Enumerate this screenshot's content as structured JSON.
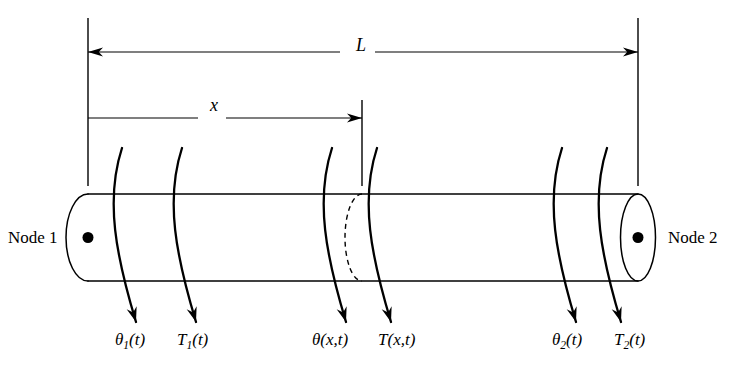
{
  "figure": {
    "stroke_color": "#000000",
    "background_color": "#ffffff",
    "shaft": {
      "left_x": 88,
      "right_x": 638,
      "top_y": 194,
      "bottom_y": 281,
      "center_y": 237.5,
      "cap_rx": 20,
      "cap_ry": 43.5
    }
  },
  "nodes": [
    {
      "id": "node-1",
      "label": "Node 1",
      "label_x": 8,
      "label_y": 229,
      "dot_x": 88,
      "dot_y": 237.5,
      "dot_r": 5.5
    },
    {
      "id": "node-2",
      "label": "Node 2",
      "label_x": 668,
      "label_y": 229,
      "dot_x": 638,
      "dot_y": 237.5,
      "dot_r": 5.5
    }
  ],
  "dimensions": [
    {
      "id": "length-dimension",
      "symbol": "L",
      "label_x": 356,
      "label_y": 36,
      "line_y": 52,
      "from_x": 88,
      "to_x": 638,
      "arrow_left": true,
      "arrow_right": true,
      "gap_left": 340,
      "gap_right": 375
    },
    {
      "id": "position-dimension",
      "symbol": "x",
      "label_x": 210,
      "label_y": 96,
      "line_y": 118,
      "from_x": 88,
      "to_x": 362,
      "arrow_left": false,
      "arrow_right": true,
      "gap_left": 198,
      "gap_right": 226
    }
  ],
  "extension_lines": [
    {
      "id": "extension-left",
      "x": 88,
      "y1": 18,
      "y2": 186
    },
    {
      "id": "extension-station",
      "x": 362,
      "y1": 100,
      "y2": 186
    },
    {
      "id": "extension-right",
      "x": 638,
      "y1": 18,
      "y2": 186
    }
  ],
  "station_marker": {
    "id": "cross-section-station",
    "x": 362,
    "center_y": 237.5,
    "ry": 43.5,
    "rx": 17,
    "style": "dashed",
    "dash_pattern": "5 4"
  },
  "torsion_arrows": [
    {
      "id": "torsion-arrow-theta-1",
      "x": 122,
      "start_y": 148,
      "end_y": 322,
      "bulge": -17
    },
    {
      "id": "torsion-arrow-T-1",
      "x": 182,
      "start_y": 148,
      "end_y": 322,
      "bulge": -17
    },
    {
      "id": "torsion-arrow-theta-x",
      "x": 332,
      "start_y": 148,
      "end_y": 322,
      "bulge": -17
    },
    {
      "id": "torsion-arrow-T-x",
      "x": 377,
      "start_y": 148,
      "end_y": 322,
      "bulge": -17
    },
    {
      "id": "torsion-arrow-theta-2",
      "x": 562,
      "start_y": 148,
      "end_y": 322,
      "bulge": -17
    },
    {
      "id": "torsion-arrow-T-2",
      "x": 607,
      "start_y": 148,
      "end_y": 322,
      "bulge": -17
    }
  ],
  "variable_labels": [
    {
      "id": "label-theta-1",
      "greek": "θ",
      "subscript": "1",
      "argument": "(t)",
      "x": 115,
      "y": 331
    },
    {
      "id": "label-torque-1",
      "greek": "T",
      "subscript": "1",
      "argument": "(t)",
      "x": 177,
      "y": 331
    },
    {
      "id": "label-theta-x",
      "greek": "θ",
      "subscript": "",
      "argument": "(x,t)",
      "x": 312,
      "y": 331
    },
    {
      "id": "label-torque-x",
      "greek": "T",
      "subscript": "",
      "argument": "(x,t)",
      "x": 378,
      "y": 331
    },
    {
      "id": "label-theta-2",
      "greek": "θ",
      "subscript": "2",
      "argument": "(t)",
      "x": 552,
      "y": 331
    },
    {
      "id": "label-torque-2",
      "greek": "T",
      "subscript": "2",
      "argument": "(t)",
      "x": 614,
      "y": 331
    }
  ]
}
